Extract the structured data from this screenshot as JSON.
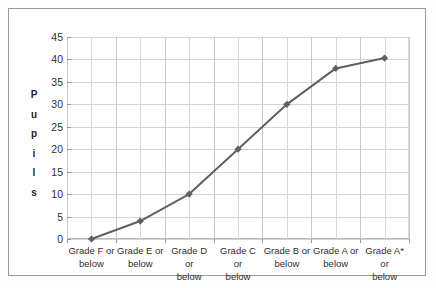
{
  "chart_data": {
    "type": "line",
    "title": "",
    "xlabel": "",
    "ylabel": "Pupils",
    "ylabel_letters": [
      "P",
      "u",
      "p",
      "i",
      "l",
      "s"
    ],
    "categories": [
      "Grade F or below",
      "Grade E or below",
      "Grade D or below",
      "Grade C or below",
      "Grade B or below",
      "Grade A or below",
      "Grade A* or below"
    ],
    "category_lines": [
      [
        "Grade F or",
        "below"
      ],
      [
        "Grade E or",
        "below"
      ],
      [
        "Grade D or",
        "below"
      ],
      [
        "Grade C or",
        "below"
      ],
      [
        "Grade B or",
        "below"
      ],
      [
        "Grade A or",
        "below"
      ],
      [
        "Grade A* or",
        "below"
      ]
    ],
    "values": [
      0,
      4,
      10,
      20,
      30,
      38,
      40.3
    ],
    "ylim": [
      0,
      45
    ],
    "yticks": [
      0,
      5,
      10,
      15,
      20,
      25,
      30,
      35,
      40,
      45
    ],
    "ytick_labels": [
      "0",
      "5",
      "10",
      "15",
      "20",
      "25",
      "30",
      "35",
      "40",
      "45"
    ],
    "grid": true,
    "legend": false,
    "marker": "diamond",
    "series_color": "#5f5f66",
    "grid_color": "#d3d3d3",
    "axis_color": "#9a9a9a",
    "plot_background": "#ffffff",
    "frame_color": "#9a9a9a"
  }
}
